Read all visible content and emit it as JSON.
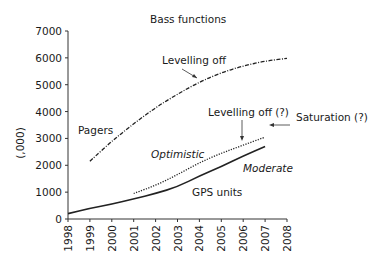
{
  "chart_data": {
    "type": "line",
    "title": "Bass functions",
    "xlabel": "",
    "ylabel": "(,000)",
    "xlim": [
      1998,
      2008
    ],
    "ylim": [
      0,
      7000
    ],
    "x_ticks": [
      "1998",
      "1999",
      "2000",
      "2001",
      "2002",
      "2003",
      "2004",
      "2005",
      "2006",
      "2007",
      "2008"
    ],
    "y_ticks": [
      "0",
      "1000",
      "2000",
      "3000",
      "4000",
      "5000",
      "6000",
      "7000"
    ],
    "grid": false,
    "series": [
      {
        "name": "Pagers",
        "style": "dash-dot",
        "x": [
          1999,
          2000,
          2001,
          2002,
          2003,
          2004,
          2005,
          2006,
          2007,
          2008
        ],
        "values": [
          2150,
          2900,
          3550,
          4150,
          4650,
          5100,
          5450,
          5700,
          5880,
          5980
        ]
      },
      {
        "name": "Optimistic",
        "style": "dotted",
        "x": [
          2001,
          2002,
          2003,
          2004,
          2005,
          2006,
          2007
        ],
        "values": [
          950,
          1250,
          1650,
          2100,
          2450,
          2750,
          3050
        ]
      },
      {
        "name": "Moderate (GPS units)",
        "style": "solid",
        "x": [
          1998,
          1999,
          2000,
          2001,
          2002,
          2003,
          2004,
          2005,
          2006,
          2007
        ],
        "values": [
          200,
          400,
          550,
          750,
          950,
          1200,
          1600,
          1950,
          2350,
          2700
        ]
      }
    ],
    "annotations": [
      {
        "text": "Levelling off",
        "target": "Pagers ~2003.6"
      },
      {
        "text": "Levelling off (?)",
        "target": "Optimistic ~2006"
      },
      {
        "text": "Saturation (?)",
        "target": "right edge ~3300"
      },
      {
        "text": "Pagers",
        "type": "series-label"
      },
      {
        "text": "Optimistic",
        "type": "series-label"
      },
      {
        "text": "Moderate",
        "type": "series-label"
      },
      {
        "text": "GPS units",
        "type": "series-label"
      }
    ]
  },
  "labels": {
    "title": "Bass functions",
    "ylabel": "(,000)",
    "levelling_off": "Levelling off",
    "levelling_off_q": "Levelling off (?)",
    "saturation": "Saturation (?)",
    "pagers": "Pagers",
    "optimistic": "Optimistic",
    "moderate": "Moderate",
    "gps": "GPS units"
  }
}
